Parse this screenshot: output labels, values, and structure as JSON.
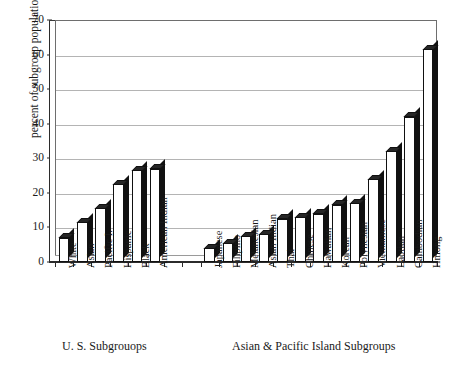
{
  "chart_data": {
    "type": "bar",
    "title": "",
    "xlabel": "",
    "ylabel": "percent of subgroup population",
    "ylim": [
      0,
      70
    ],
    "ytick_labels": [
      "0",
      "10",
      "20",
      "30",
      "40",
      "50",
      "60",
      "70"
    ],
    "ytick_values": [
      0,
      10,
      20,
      30,
      40,
      50,
      60,
      70
    ],
    "grid": true,
    "legend": "none",
    "groups": [
      {
        "caption": "U. S.  Subgrouops",
        "categories": [
          "White",
          "Asian",
          "Pacific I.",
          "Hispanic",
          "Black",
          "American Indian"
        ],
        "values": [
          7,
          11.5,
          15.5,
          22.5,
          26.5,
          27
        ]
      },
      {
        "caption": "Asian & Pacific Island Subgroups",
        "categories": [
          "Japanese",
          "Filipino",
          "Melanesian",
          "Asian Indian",
          "Thai",
          "Chinese",
          "Hawaiian",
          "Korean",
          "Polynesian",
          "Vietnamese",
          "Laotian",
          "Cambodian",
          "Hmong"
        ],
        "values": [
          4,
          5.5,
          7.5,
          8,
          12.5,
          13,
          14,
          16.5,
          17,
          24,
          32,
          42,
          61.5
        ]
      }
    ],
    "categories": [
      "White",
      "Asian",
      "Pacific I.",
      "Hispanic",
      "Black",
      "American Indian",
      "Japanese",
      "Filipino",
      "Melanesian",
      "Asian Indian",
      "Thai",
      "Chinese",
      "Hawaiian",
      "Korean",
      "Polynesian",
      "Vietnamese",
      "Laotian",
      "Cambodian",
      "Hmong"
    ],
    "values": [
      7,
      11.5,
      15.5,
      22.5,
      26.5,
      27,
      4,
      5.5,
      7.5,
      8,
      12.5,
      13,
      14,
      16.5,
      17,
      24,
      32,
      42,
      61.5
    ],
    "colors": {
      "bar_face": "#ffffff",
      "bar_side": "#111111",
      "bar_outline": "#111111",
      "gridline": "#b4b4b4",
      "axis": "#2b2b2b",
      "text": "#1a1a1a",
      "background": "#ffffff"
    }
  }
}
